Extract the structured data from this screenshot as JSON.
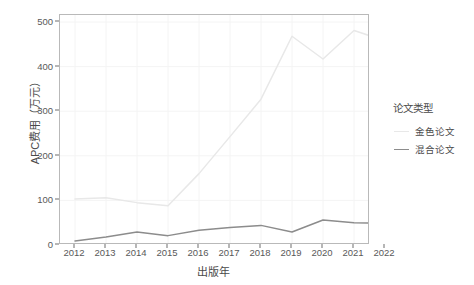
{
  "chart_data": {
    "type": "line",
    "title": "",
    "xlabel": "出版年",
    "ylabel": "APC费用（万元）",
    "x": [
      2012,
      2013,
      2014,
      2015,
      2016,
      2017,
      2018,
      2019,
      2020,
      2021,
      2022
    ],
    "xticklabels": [
      "2012",
      "2013",
      "2014",
      "2015",
      "2016",
      "2017",
      "2018",
      "2019",
      "2020",
      "2021",
      "2022"
    ],
    "yticklabels": [
      "0",
      "100",
      "200",
      "300",
      "400",
      "500"
    ],
    "yticks": [
      0,
      100,
      200,
      300,
      400,
      500
    ],
    "ylim": [
      -12,
      512
    ],
    "xlim": [
      2011.5,
      2022.5
    ],
    "grid": true,
    "legend_position": "right",
    "series": [
      {
        "name": "金色论文",
        "color": "#e8e8e8",
        "values": [
          103,
          106,
          95,
          88,
          160,
          243,
          327,
          468,
          417,
          481,
          458
        ]
      },
      {
        "name": "混合论文",
        "color": "#8c8c8c",
        "values": [
          9,
          18,
          29,
          21,
          33,
          39,
          44,
          29,
          56,
          50,
          48
        ]
      }
    ]
  },
  "legend": {
    "title": "论文类型",
    "items": [
      {
        "label": "金色论文",
        "color": "#e8e8e8"
      },
      {
        "label": "混合论文",
        "color": "#8c8c8c"
      }
    ]
  },
  "colors": {
    "panel_background": "#ffffff",
    "panel_border": "#b9b9b9",
    "grid": "#f4f4f4",
    "axis_text": "#595959",
    "title_text": "#4a4a4a",
    "gold_series": "#e8e8e8",
    "hybrid_series": "#8c8c8c"
  }
}
